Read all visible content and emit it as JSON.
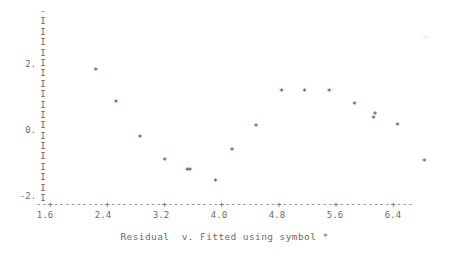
{
  "caption": "Residual  v. Fitted using symbol *",
  "symbol": "*",
  "axis": {
    "y_axis_glyph_top": "-",
    "y_axis_glyph": "I",
    "x_axis_line": "--+---------+---------+---------+---------+---------+---------+---",
    "tick_marker": "+"
  },
  "chart_data": {
    "type": "scatter",
    "title": "",
    "subtitle": "",
    "xlabel": "Fitted",
    "ylabel": "Residual",
    "annotations": [
      "Residual  v. Fitted using symbol *"
    ],
    "grid": false,
    "legend": "none",
    "marker": "*",
    "xlim": [
      1.6,
      6.72
    ],
    "ylim": [
      -2.4,
      2.64
    ],
    "xticks": [
      1.6,
      2.4,
      3.2,
      4.0,
      4.8,
      5.6,
      6.4
    ],
    "xticklabels": [
      "1.6",
      "2.4",
      "3.2",
      "4.0",
      "4.8",
      "5.6",
      "6.4"
    ],
    "yticks": [
      2,
      0,
      -2
    ],
    "yticklabels": [
      "2.",
      "0.",
      "-2."
    ],
    "points": [
      {
        "x": 2.3,
        "y": 1.76
      },
      {
        "x": 2.58,
        "y": 0.79
      },
      {
        "x": 2.91,
        "y": -0.27
      },
      {
        "x": 3.25,
        "y": -0.97
      },
      {
        "x": 3.56,
        "y": -1.27
      },
      {
        "x": 3.6,
        "y": -1.27
      },
      {
        "x": 3.95,
        "y": -1.61
      },
      {
        "x": 4.18,
        "y": -0.67
      },
      {
        "x": 4.51,
        "y": 0.06
      },
      {
        "x": 4.86,
        "y": 1.12
      },
      {
        "x": 5.18,
        "y": 1.12
      },
      {
        "x": 5.52,
        "y": 1.12
      },
      {
        "x": 5.87,
        "y": 0.73
      },
      {
        "x": 6.13,
        "y": 0.3
      },
      {
        "x": 6.15,
        "y": 0.42
      },
      {
        "x": 6.46,
        "y": 0.09
      },
      {
        "x": 6.83,
        "y": -1.0
      }
    ]
  },
  "ylabels": [
    {
      "text": "2.",
      "value": 2
    },
    {
      "text": "0.",
      "value": 0
    },
    {
      "text": "-2.",
      "value": -2
    }
  ]
}
